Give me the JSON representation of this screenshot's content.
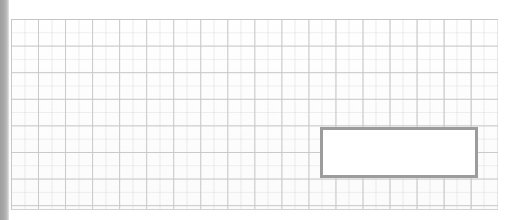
{
  "document": {
    "type": "scanned-grid-sheet",
    "title": "",
    "background_color": "#fefefe"
  },
  "edge_band": {
    "name": "left-scan-shadow",
    "color": "#a9a9a9",
    "width_px": 9
  },
  "grid": {
    "line_color": "#c9c9c9",
    "faint_line_color": "#c8c8c8",
    "origin_x": 11,
    "origin_y": 19,
    "width_px": 487,
    "height_px": 191,
    "cell_width_px": 27,
    "cell_height_px": 26.6,
    "columns": 18,
    "rows": 7
  },
  "annotation": {
    "name": "highlighted-rectangle",
    "border_color": "#9c9c9c",
    "border_width_px": 3,
    "fill_color": "#ffffff",
    "x": 320,
    "y": 127,
    "width_px": 158,
    "height_px": 51,
    "label": ""
  },
  "margins": {
    "top_px": 19,
    "bottom_px": 10,
    "right_px": 13,
    "color": "#ffffff"
  }
}
